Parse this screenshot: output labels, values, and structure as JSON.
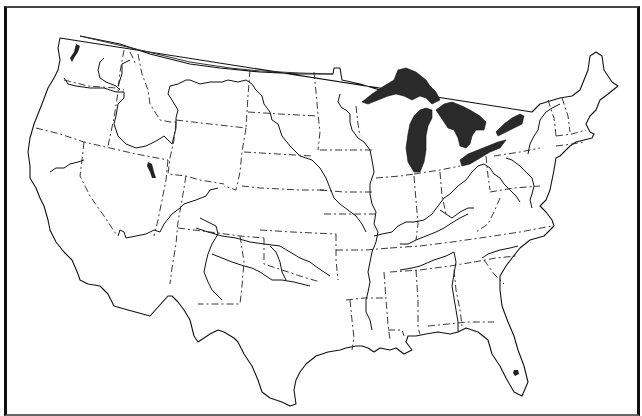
{
  "caption": {
    "text": ""
  },
  "map": {
    "title": "Contiguous United States with state and major river basin boundaries",
    "region": "Contiguous United States",
    "legend_styles": {
      "national_outline": "solid",
      "state_boundaries": "dash-dot",
      "river_basin_boundaries": "solid",
      "great_lakes": "filled dark"
    },
    "colors": {
      "background": "#ffffff",
      "lines": "#111111",
      "lakes": "#2a2a2a",
      "frame": "#111111"
    },
    "features": {
      "great_lakes": [
        "Lake Superior",
        "Lake Michigan",
        "Lake Huron",
        "Lake Erie",
        "Lake Ontario"
      ],
      "other_lakes": [
        "Great Salt Lake",
        "Lake Okeechobee"
      ]
    }
  }
}
